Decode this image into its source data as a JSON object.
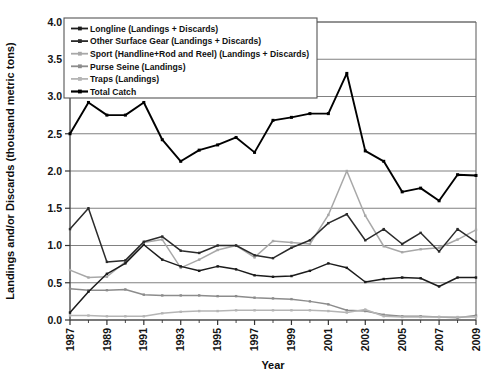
{
  "chart_data": {
    "type": "line",
    "title": "",
    "xlabel": "Year",
    "ylabel": "Landings and/or Discards (thousand metric tons)",
    "xlim": [
      1987,
      2009
    ],
    "ylim": [
      0.0,
      4.0
    ],
    "ytick_labels": [
      "0.0",
      "0.5",
      "1.0",
      "1.5",
      "2.0",
      "2.5",
      "3.0",
      "3.5",
      "4.0"
    ],
    "ytick_values": [
      0.0,
      0.5,
      1.0,
      1.5,
      2.0,
      2.5,
      3.0,
      3.5,
      4.0
    ],
    "xtick_labels": [
      "1987",
      "1989",
      "1991",
      "1993",
      "1995",
      "1997",
      "1999",
      "2001",
      "2003",
      "2005",
      "2007",
      "2009"
    ],
    "x": [
      1987,
      1988,
      1989,
      1990,
      1991,
      1992,
      1993,
      1994,
      1995,
      1996,
      1997,
      1998,
      1999,
      2000,
      2001,
      2002,
      2003,
      2004,
      2005,
      2006,
      2007,
      2008,
      2009
    ],
    "grid": "horizontal",
    "legend_position": "top-left",
    "series": [
      {
        "name": "Longline (Landings + Discards)",
        "color": "#1c1c1c",
        "marker": "square",
        "values": [
          0.1,
          0.38,
          0.62,
          0.76,
          1.01,
          0.81,
          0.72,
          0.66,
          0.72,
          0.68,
          0.6,
          0.58,
          0.59,
          0.66,
          0.76,
          0.7,
          0.51,
          0.55,
          0.57,
          0.56,
          0.45,
          0.57,
          0.57
        ]
      },
      {
        "name": "Other Surface Gear (Landings + Discards)",
        "color": "#2b2b2b",
        "marker": "square",
        "values": [
          1.22,
          1.5,
          0.78,
          0.8,
          1.05,
          1.12,
          0.93,
          0.9,
          1.0,
          1.0,
          0.87,
          0.83,
          0.97,
          1.07,
          1.3,
          1.42,
          1.07,
          1.22,
          1.02,
          1.17,
          0.92,
          1.22,
          1.05
        ]
      },
      {
        "name": "Sport (Handline+Rod and Reel) (Landings + Discards)",
        "color": "#a8a8a8",
        "marker": "square",
        "values": [
          0.67,
          0.57,
          0.58,
          0.78,
          1.04,
          1.08,
          0.7,
          0.81,
          0.94,
          1.0,
          0.84,
          1.06,
          1.04,
          1.02,
          1.41,
          2.0,
          1.4,
          0.99,
          0.91,
          0.95,
          0.97,
          1.08,
          1.21
        ]
      },
      {
        "name": "Purse Seine (Landings)",
        "color": "#8c8c8c",
        "marker": "square",
        "values": [
          0.42,
          0.4,
          0.4,
          0.41,
          0.34,
          0.33,
          0.33,
          0.33,
          0.32,
          0.32,
          0.3,
          0.29,
          0.28,
          0.25,
          0.21,
          0.13,
          0.12,
          0.07,
          0.05,
          0.05,
          0.04,
          0.03,
          0.06
        ]
      },
      {
        "name": "Traps (Landings)",
        "color": "#b5b5b5",
        "marker": "square",
        "values": [
          0.06,
          0.06,
          0.05,
          0.05,
          0.05,
          0.09,
          0.11,
          0.12,
          0.12,
          0.13,
          0.13,
          0.13,
          0.13,
          0.13,
          0.12,
          0.1,
          0.14,
          0.05,
          0.04,
          0.04,
          0.04,
          0.04,
          0.04
        ]
      },
      {
        "name": "Total Catch",
        "color": "#000000",
        "marker": "square",
        "values": [
          2.5,
          2.92,
          2.75,
          2.75,
          2.92,
          2.42,
          2.13,
          2.28,
          2.35,
          2.45,
          2.25,
          2.68,
          2.72,
          2.77,
          2.77,
          3.31,
          2.27,
          2.13,
          1.72,
          1.77,
          1.6,
          1.95,
          1.94
        ]
      }
    ]
  },
  "legend": {
    "items": [
      "Longline (Landings + Discards)",
      "Other Surface Gear (Landings + Discards)",
      "Sport (Handline+Rod and Reel) (Landings + Discards)",
      "Purse Seine (Landings)",
      "Traps (Landings)",
      "Total Catch"
    ]
  }
}
